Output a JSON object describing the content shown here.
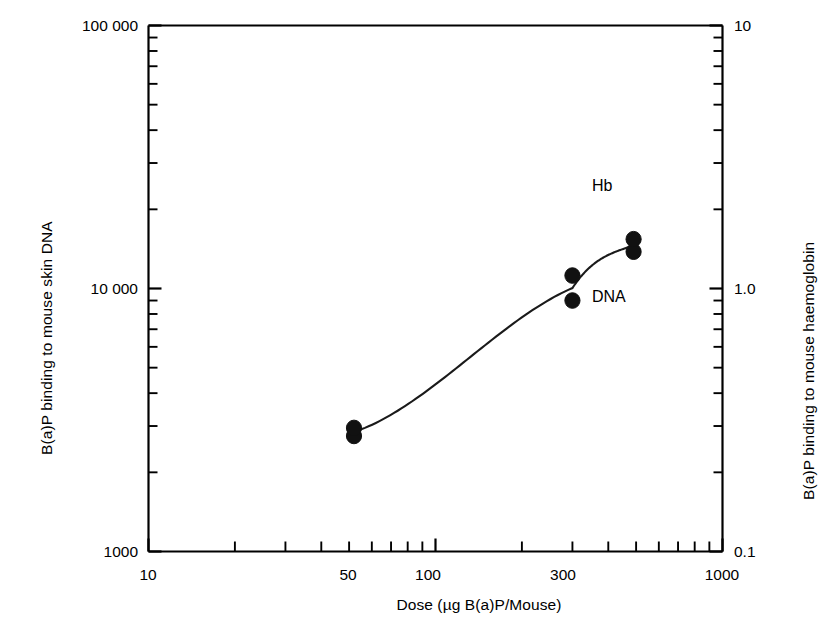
{
  "chart_data": {
    "type": "scatter",
    "title": "",
    "subtitle": "",
    "xlabel": "Dose (µg B(a)P/Mouse)",
    "ylabel": "B(a)P binding to mouse skin DNA",
    "y2label": "B(a)P binding to mouse haemoglobin",
    "xscale": "log",
    "yscale": "log",
    "y2scale": "log",
    "xlim": [
      10,
      1000
    ],
    "ylim": [
      1000,
      100000
    ],
    "y2lim": [
      0.1,
      10
    ],
    "grid": false,
    "legend_position": "inline-annotation",
    "xticks": [
      10,
      50,
      100,
      300,
      1000
    ],
    "xtick_labels": [
      "10",
      "50",
      "100",
      "300",
      "1000"
    ],
    "yticks": [
      1000,
      10000,
      100000
    ],
    "ytick_labels": [
      "1000",
      "10 000",
      "100 000"
    ],
    "y2ticks": [
      0.1,
      1.0,
      10
    ],
    "y2tick_labels": [
      "0.1",
      "1.0",
      "10"
    ],
    "series": [
      {
        "name": "Hb",
        "axis": "right",
        "marker": "open-circle",
        "points": [
          {
            "x": 52,
            "y": 7200
          },
          {
            "x": 52,
            "y": 7500
          },
          {
            "x": 300,
            "y": 24000
          },
          {
            "x": 300,
            "y": 25500
          },
          {
            "x": 490,
            "y": 40000
          },
          {
            "x": 490,
            "y": 42500
          }
        ]
      },
      {
        "name": "DNA",
        "axis": "left",
        "marker": "filled-circle",
        "points": [
          {
            "x": 52,
            "y": 2750
          },
          {
            "x": 52,
            "y": 2950
          },
          {
            "x": 300,
            "y": 9000
          },
          {
            "x": 300,
            "y": 11200
          },
          {
            "x": 490,
            "y": 13800
          },
          {
            "x": 490,
            "y": 15400
          }
        ]
      }
    ],
    "annotations": [
      {
        "text": "Hb",
        "x": 400,
        "y": 26000
      },
      {
        "text": "DNA",
        "x": 400,
        "y": 9500
      }
    ]
  }
}
